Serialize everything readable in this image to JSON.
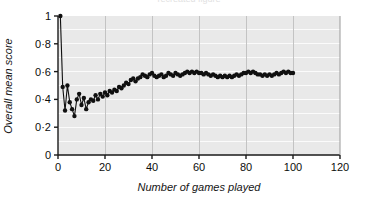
{
  "figure": {
    "background_color": "#ffffff",
    "caption_remnant": "recreated figure"
  },
  "chart_data": {
    "type": "line",
    "title": "",
    "subtitle": "",
    "xlabel": "Number of games played",
    "ylabel": "Overall mean score",
    "xlim": [
      0,
      120
    ],
    "ylim": [
      0,
      1
    ],
    "xticks": [
      0,
      20,
      40,
      60,
      80,
      100,
      120
    ],
    "xtick_labels": [
      "0",
      "20",
      "40",
      "60",
      "80",
      "100",
      "120"
    ],
    "yticks": [
      0,
      0.2,
      0.4,
      0.6,
      0.8,
      1
    ],
    "ytick_labels": [
      "0",
      "0·2",
      "0·4",
      "0·6",
      "0·8",
      "1"
    ],
    "grid": {
      "horizontal": true,
      "horizontal_step": 0.1,
      "vertical": true,
      "vertical_step": 20,
      "color": "#fbfbfb",
      "vertical_color": "#c3c3c3"
    },
    "legend": null,
    "plot_background": "#e9e9e9",
    "series": [
      {
        "name": "Overall mean score",
        "color": "#101010",
        "marker": "circle",
        "marker_size": 2.2,
        "line_width": 1.1,
        "x": [
          1,
          2,
          3,
          4,
          5,
          6,
          7,
          8,
          9,
          10,
          11,
          12,
          13,
          14,
          15,
          16,
          17,
          18,
          19,
          20,
          21,
          22,
          23,
          24,
          25,
          26,
          27,
          28,
          29,
          30,
          31,
          32,
          33,
          34,
          35,
          36,
          37,
          38,
          39,
          40,
          41,
          42,
          43,
          44,
          45,
          46,
          47,
          48,
          49,
          50,
          51,
          52,
          53,
          54,
          55,
          56,
          57,
          58,
          59,
          60,
          61,
          62,
          63,
          64,
          65,
          66,
          67,
          68,
          69,
          70,
          71,
          72,
          73,
          74,
          75,
          76,
          77,
          78,
          79,
          80,
          81,
          82,
          83,
          84,
          85,
          86,
          87,
          88,
          89,
          90,
          91,
          92,
          93,
          94,
          95,
          96,
          97,
          98,
          99,
          100
        ],
        "values": [
          1.0,
          0.49,
          0.32,
          0.5,
          0.38,
          0.33,
          0.28,
          0.4,
          0.44,
          0.36,
          0.41,
          0.33,
          0.38,
          0.4,
          0.39,
          0.43,
          0.4,
          0.44,
          0.42,
          0.45,
          0.43,
          0.46,
          0.45,
          0.47,
          0.46,
          0.49,
          0.48,
          0.5,
          0.52,
          0.51,
          0.54,
          0.55,
          0.53,
          0.55,
          0.56,
          0.58,
          0.57,
          0.56,
          0.58,
          0.59,
          0.57,
          0.56,
          0.57,
          0.58,
          0.56,
          0.57,
          0.59,
          0.58,
          0.57,
          0.59,
          0.58,
          0.57,
          0.58,
          0.59,
          0.6,
          0.59,
          0.6,
          0.59,
          0.6,
          0.59,
          0.59,
          0.58,
          0.59,
          0.58,
          0.57,
          0.58,
          0.57,
          0.56,
          0.57,
          0.56,
          0.57,
          0.56,
          0.57,
          0.56,
          0.57,
          0.58,
          0.57,
          0.58,
          0.59,
          0.59,
          0.6,
          0.59,
          0.6,
          0.59,
          0.58,
          0.58,
          0.57,
          0.58,
          0.57,
          0.58,
          0.57,
          0.58,
          0.59,
          0.58,
          0.59,
          0.6,
          0.59,
          0.6,
          0.59,
          0.59
        ]
      }
    ]
  }
}
